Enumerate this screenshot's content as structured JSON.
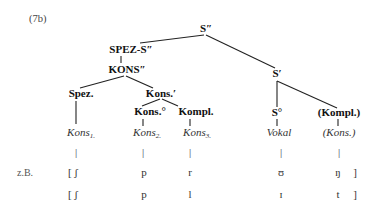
{
  "example_label": "(7b)",
  "tree": {
    "root": "S″",
    "spez_s": "SPEZ-S″",
    "kons_dbl": "KONS″",
    "s_bar": "S′",
    "spez": "Spez.",
    "kons_bar": "Kons.′",
    "kons_zero": "Kons.°",
    "kompl": "Kompl.",
    "s_zero": "S°",
    "kompl_opt": "(Kompl.)"
  },
  "leaves": {
    "kons1": {
      "base": "Kons",
      "sub": "1."
    },
    "kons2": {
      "base": "Kons",
      "sub": "2."
    },
    "kons3": {
      "base": "Kons",
      "sub": "3."
    },
    "vokal": "Vokal",
    "kons_opt": "(Kons.)"
  },
  "bar_glyph": "|",
  "examples": {
    "label": "z.B.",
    "rows": [
      {
        "c1": "[ ʃ",
        "c2": "p",
        "c3": "r",
        "v": "ʊ",
        "c4": "ŋ",
        "close": "]"
      },
      {
        "c1": "[ ʃ",
        "c2": "p",
        "c3": "l",
        "v": "ɪ",
        "c4": "t",
        "close": "]"
      }
    ]
  }
}
